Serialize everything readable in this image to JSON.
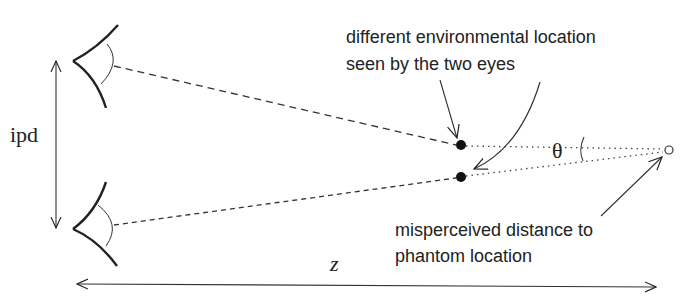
{
  "diagram": {
    "labels": {
      "ipd": "ipd",
      "z": "z",
      "theta": "θ",
      "top_annotation_line1": "different environmental location",
      "top_annotation_line2": "seen by the two eyes",
      "bottom_annotation_line1": "misperceived distance to",
      "bottom_annotation_line2": "phantom location"
    },
    "elements": {
      "eyes": [
        "top-eye",
        "bottom-eye"
      ],
      "points": [
        "environment-point-top",
        "environment-point-bottom",
        "phantom-point"
      ]
    },
    "colors": {
      "stroke": "#222222",
      "background": "#ffffff"
    }
  }
}
